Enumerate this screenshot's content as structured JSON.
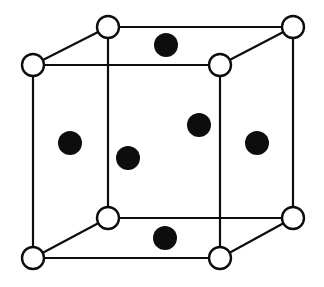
{
  "figure": {
    "background_color": "#ffffff",
    "line_color": "#0d0d0d",
    "corner_atom_fill": "#ffffff",
    "interior_atom_fill": "#0d0d0d",
    "canvas": {
      "width": 324,
      "height": 287
    }
  },
  "chart_data": {
    "type": "scatter",
    "xlabel": "",
    "ylabel": "",
    "xlim": [
      0,
      324
    ],
    "ylim": [
      0,
      287
    ],
    "grid": false,
    "legend": "none",
    "projection": "oblique",
    "series": [
      {
        "name": "corner-atoms",
        "marker": "open-circle",
        "radius": 11,
        "stroke": "#0d0d0d",
        "fill": "#ffffff",
        "points": [
          {
            "id": "corner-front-top-left",
            "x": 33,
            "y": 65,
            "label": "front top left"
          },
          {
            "id": "corner-front-top-right",
            "x": 220,
            "y": 65,
            "label": "front top right"
          },
          {
            "id": "corner-back-top-left",
            "x": 108,
            "y": 27,
            "label": "back top left"
          },
          {
            "id": "corner-back-top-right",
            "x": 293,
            "y": 27,
            "label": "back top right"
          },
          {
            "id": "corner-front-bottom-left",
            "x": 33,
            "y": 258,
            "label": "front bottom left"
          },
          {
            "id": "corner-front-bottom-right",
            "x": 220,
            "y": 258,
            "label": "front bottom right"
          },
          {
            "id": "corner-back-bottom-left",
            "x": 108,
            "y": 218,
            "label": "back bottom left"
          },
          {
            "id": "corner-back-bottom-right",
            "x": 293,
            "y": 218,
            "label": "back bottom right"
          }
        ]
      },
      {
        "name": "face-centre-atoms",
        "marker": "filled-circle",
        "radius": 12,
        "stroke": "none",
        "fill": "#0d0d0d",
        "points": [
          {
            "id": "atom-top-face",
            "x": 166,
            "y": 45,
            "r": 12,
            "label": "top face centre"
          },
          {
            "id": "atom-left-face",
            "x": 70,
            "y": 143,
            "r": 12,
            "label": "left face centre"
          },
          {
            "id": "atom-front-face",
            "x": 128,
            "y": 158,
            "r": 12,
            "label": "front face centre"
          },
          {
            "id": "atom-back-face",
            "x": 199,
            "y": 125,
            "r": 12,
            "label": "back face centre"
          },
          {
            "id": "atom-right-face",
            "x": 257,
            "y": 143,
            "r": 12,
            "label": "right face centre"
          },
          {
            "id": "atom-bottom-face",
            "x": 165,
            "y": 238,
            "r": 12,
            "label": "bottom face centre"
          }
        ]
      }
    ],
    "edges": [
      {
        "id": "edge-front-top",
        "x1": 33,
        "y1": 65,
        "x2": 220,
        "y2": 65,
        "style": "solid",
        "width": 2.2
      },
      {
        "id": "edge-front-bottom",
        "x1": 33,
        "y1": 258,
        "x2": 220,
        "y2": 258,
        "style": "solid",
        "width": 2.2
      },
      {
        "id": "edge-front-left",
        "x1": 33,
        "y1": 65,
        "x2": 33,
        "y2": 258,
        "style": "solid",
        "width": 2.2
      },
      {
        "id": "edge-front-right",
        "x1": 220,
        "y1": 65,
        "x2": 220,
        "y2": 258,
        "style": "solid",
        "width": 2.2
      },
      {
        "id": "edge-back-top",
        "x1": 108,
        "y1": 27,
        "x2": 293,
        "y2": 27,
        "style": "solid",
        "width": 2.2
      },
      {
        "id": "edge-back-bottom",
        "x1": 108,
        "y1": 218,
        "x2": 293,
        "y2": 218,
        "style": "solid",
        "width": 2.2
      },
      {
        "id": "edge-back-left",
        "x1": 108,
        "y1": 27,
        "x2": 108,
        "y2": 218,
        "style": "solid",
        "width": 2.2
      },
      {
        "id": "edge-back-right",
        "x1": 293,
        "y1": 27,
        "x2": 293,
        "y2": 218,
        "style": "solid",
        "width": 2.2
      },
      {
        "id": "edge-diag-top-left",
        "x1": 33,
        "y1": 65,
        "x2": 108,
        "y2": 27,
        "style": "solid",
        "width": 2.2
      },
      {
        "id": "edge-diag-top-right",
        "x1": 220,
        "y1": 65,
        "x2": 293,
        "y2": 27,
        "style": "solid",
        "width": 2.2
      },
      {
        "id": "edge-diag-bottom-left",
        "x1": 33,
        "y1": 258,
        "x2": 108,
        "y2": 218,
        "style": "solid",
        "width": 2.2
      },
      {
        "id": "edge-diag-bottom-right",
        "x1": 220,
        "y1": 258,
        "x2": 293,
        "y2": 218,
        "style": "solid",
        "width": 2.2
      }
    ]
  }
}
